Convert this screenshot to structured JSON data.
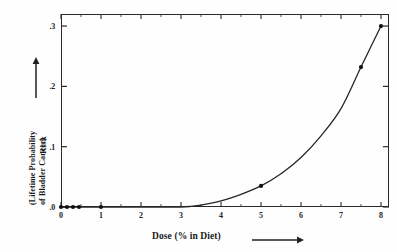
{
  "chart_data": {
    "type": "line",
    "title": "",
    "subtitle": "",
    "xlabel": "Dose (% in Diet)",
    "ylabel": "Risk",
    "ylabel_sub_line1": "(Lifetime Probability",
    "ylabel_sub_line2": "of Bladder Cancer)",
    "xlim": [
      0,
      8.2
    ],
    "ylim": [
      0,
      0.32
    ],
    "grid": false,
    "legend": null,
    "x_ticks": [
      0,
      1,
      2,
      3,
      4,
      5,
      6,
      7,
      8
    ],
    "x_tick_labels": [
      "0",
      "1",
      "2",
      "3",
      "4",
      "5",
      "6",
      "7",
      "8"
    ],
    "y_ticks": [
      0.0,
      0.1,
      0.2,
      0.3
    ],
    "y_tick_labels": [
      ".0",
      ".1",
      ".2",
      ".3"
    ],
    "series": [
      {
        "name": "Fitted dose-response curve",
        "type": "line",
        "x": [
          0,
          0.5,
          1.0,
          1.5,
          2.0,
          2.5,
          3.0,
          3.25,
          3.5,
          4.0,
          4.5,
          5.0,
          5.5,
          6.0,
          6.5,
          7.0,
          7.5,
          8.0
        ],
        "y": [
          0.0,
          0.0,
          0.0,
          0.0,
          0.0,
          0.0,
          0.0,
          0.001,
          0.003,
          0.01,
          0.021,
          0.035,
          0.055,
          0.082,
          0.118,
          0.163,
          0.232,
          0.3
        ]
      },
      {
        "name": "Observed data points",
        "type": "scatter",
        "x": [
          0.0,
          0.15,
          0.3,
          0.45,
          1.0,
          5.0,
          7.5,
          8.0
        ],
        "y": [
          0.0,
          0.0,
          0.0,
          0.0,
          0.0,
          0.035,
          0.232,
          0.3
        ]
      }
    ],
    "annotations": [
      {
        "name": "x-axis-direction-arrow",
        "text": "→"
      },
      {
        "name": "y-axis-direction-arrow",
        "text": "↑"
      }
    ],
    "colors": {
      "curve": "#262626",
      "marker": "#111111",
      "axis": "#2a2a2a",
      "text": "#1f1f1f",
      "background": "#fefefe"
    }
  }
}
